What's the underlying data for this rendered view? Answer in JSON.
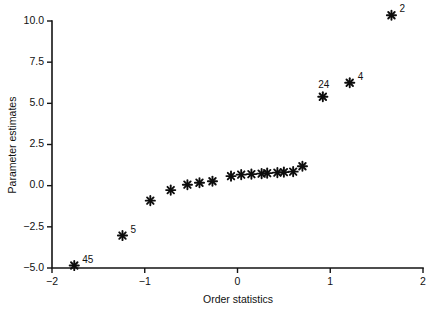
{
  "chart_data": {
    "type": "scatter",
    "title": "",
    "subtitle": "",
    "xlabel": "Order statistics",
    "ylabel": "Parameter estimates",
    "xlim": [
      -2,
      2
    ],
    "ylim": [
      -5.0,
      10.0
    ],
    "xticks": [
      -2,
      -1,
      0,
      1,
      2
    ],
    "xtick_labels": [
      "−2",
      "−1",
      "0",
      "1",
      "2"
    ],
    "yticks": [
      -5.0,
      -2.5,
      0.0,
      2.5,
      5.0,
      7.5,
      10.0
    ],
    "ytick_labels": [
      "−5.0",
      "−2.5",
      "0.0",
      "2.5",
      "5.0",
      "7.5",
      "10.0"
    ],
    "grid": false,
    "legend": "none",
    "marker": "asterisk",
    "marker_color": "#0d0d0d",
    "points": [
      {
        "x": -1.76,
        "y": -4.85,
        "label": "45",
        "label_pos": "right"
      },
      {
        "x": -1.24,
        "y": -3.03,
        "label": "5",
        "label_pos": "right"
      },
      {
        "x": -0.94,
        "y": -0.91,
        "label": "",
        "label_pos": ""
      },
      {
        "x": -0.72,
        "y": -0.27,
        "label": "",
        "label_pos": ""
      },
      {
        "x": -0.54,
        "y": 0.06,
        "label": "",
        "label_pos": ""
      },
      {
        "x": -0.41,
        "y": 0.18,
        "label": "",
        "label_pos": ""
      },
      {
        "x": -0.27,
        "y": 0.27,
        "label": "",
        "label_pos": ""
      },
      {
        "x": -0.07,
        "y": 0.58,
        "label": "",
        "label_pos": ""
      },
      {
        "x": 0.04,
        "y": 0.67,
        "label": "",
        "label_pos": ""
      },
      {
        "x": 0.15,
        "y": 0.7,
        "label": "",
        "label_pos": ""
      },
      {
        "x": 0.26,
        "y": 0.73,
        "label": "",
        "label_pos": ""
      },
      {
        "x": 0.32,
        "y": 0.76,
        "label": "",
        "label_pos": ""
      },
      {
        "x": 0.43,
        "y": 0.79,
        "label": "",
        "label_pos": ""
      },
      {
        "x": 0.5,
        "y": 0.82,
        "label": "",
        "label_pos": ""
      },
      {
        "x": 0.6,
        "y": 0.85,
        "label": "",
        "label_pos": ""
      },
      {
        "x": 0.7,
        "y": 1.18,
        "label": "",
        "label_pos": ""
      },
      {
        "x": 0.92,
        "y": 5.4,
        "label": "24",
        "label_pos": "above-left"
      },
      {
        "x": 1.21,
        "y": 6.25,
        "label": "4",
        "label_pos": "right"
      },
      {
        "x": 1.66,
        "y": 10.35,
        "label": "2",
        "label_pos": "right"
      }
    ]
  }
}
